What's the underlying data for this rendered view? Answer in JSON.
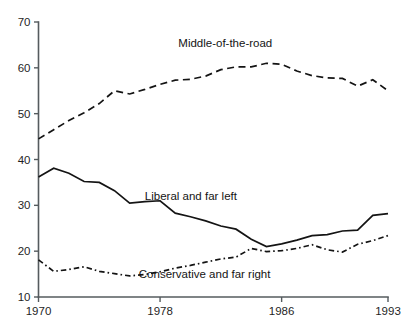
{
  "chart_data": {
    "type": "line",
    "title": "",
    "subtitle": "",
    "xlabel": "",
    "ylabel": "",
    "xlim": [
      1970,
      1993
    ],
    "ylim": [
      10,
      70
    ],
    "grid": false,
    "legend_position": "inline-annotations",
    "x_ticks": [
      1970,
      1978,
      1986,
      1993
    ],
    "x_tick_labels": [
      "1970",
      "1978",
      "1986",
      "1993"
    ],
    "y_ticks": [
      10,
      20,
      30,
      40,
      50,
      60,
      70
    ],
    "y_tick_labels": [
      "10",
      "20",
      "30",
      "40",
      "50",
      "60",
      "70"
    ],
    "x": [
      1970,
      1971,
      1972,
      1973,
      1974,
      1975,
      1976,
      1977,
      1978,
      1979,
      1980,
      1981,
      1982,
      1983,
      1984,
      1985,
      1986,
      1987,
      1988,
      1989,
      1990,
      1991,
      1992,
      1993
    ],
    "series": [
      {
        "name": "Middle-of-the-road",
        "label": "Middle-of-the-road",
        "style": "dashed",
        "color": "#141414",
        "label_x": 1979.2,
        "label_y": 64.6,
        "values": [
          44.5,
          46.5,
          48.5,
          50.2,
          52.2,
          55.0,
          54.3,
          55.3,
          56.4,
          57.3,
          57.5,
          58.2,
          59.6,
          60.2,
          60.2,
          61.0,
          60.8,
          59.3,
          58.3,
          57.8,
          57.7,
          56.0,
          57.4,
          55.0
        ]
      },
      {
        "name": "Liberal and far left",
        "label": "Liberal and far left",
        "style": "solid",
        "color": "#141414",
        "label_x": 1977.0,
        "label_y": 31.2,
        "values": [
          36.2,
          38.1,
          37.0,
          35.2,
          35.0,
          33.2,
          30.5,
          30.8,
          31.0,
          28.3,
          27.5,
          26.6,
          25.5,
          24.8,
          22.6,
          21.0,
          21.6,
          22.4,
          23.4,
          23.6,
          24.4,
          24.6,
          27.8,
          28.2
        ]
      },
      {
        "name": "Conservative and far right",
        "label": "Conservative and far right",
        "style": "dash-dot",
        "color": "#141414",
        "label_x": 1976.6,
        "label_y": 14.1,
        "values": [
          18.1,
          15.6,
          16.0,
          16.6,
          15.6,
          15.1,
          14.6,
          14.9,
          15.5,
          16.3,
          16.9,
          17.6,
          18.3,
          18.7,
          20.6,
          19.9,
          20.1,
          20.6,
          21.4,
          20.3,
          19.8,
          21.5,
          22.3,
          23.4
        ]
      }
    ]
  }
}
